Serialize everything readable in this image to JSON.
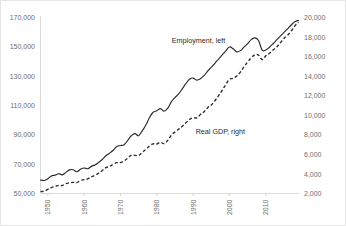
{
  "chart_data": {
    "type": "line",
    "title": "",
    "subtitle": "",
    "xlabel": "",
    "ylabel": "",
    "grid": false,
    "legend_position": "inline-annotation",
    "x": [
      1948,
      1949,
      1950,
      1951,
      1952,
      1953,
      1954,
      1955,
      1956,
      1957,
      1958,
      1959,
      1960,
      1961,
      1962,
      1963,
      1964,
      1965,
      1966,
      1967,
      1968,
      1969,
      1970,
      1971,
      1972,
      1973,
      1974,
      1975,
      1976,
      1977,
      1978,
      1979,
      1980,
      1981,
      1982,
      1983,
      1984,
      1985,
      1986,
      1987,
      1988,
      1989,
      1990,
      1991,
      1992,
      1993,
      1994,
      1995,
      1996,
      1997,
      1998,
      1999,
      2000,
      2001,
      2002,
      2003,
      2004,
      2005,
      2006,
      2007,
      2008,
      2009,
      2010,
      2011,
      2012,
      2013,
      2014,
      2015,
      2016,
      2017,
      2018,
      2019
    ],
    "x_tick_labels": [
      "1950",
      "1960",
      "1970",
      "1980",
      "1990",
      "2000",
      "2010"
    ],
    "x_tick_values": [
      1950,
      1960,
      1970,
      1980,
      1990,
      2000,
      2010
    ],
    "xlim": [
      1948,
      2019
    ],
    "series": [
      {
        "name": "Employment, left",
        "axis": "left",
        "style": "solid",
        "color": "#2a2a2a",
        "values": [
          59200,
          58900,
          60000,
          62000,
          62500,
          63500,
          62700,
          64400,
          66100,
          66200,
          64800,
          66500,
          67400,
          66900,
          68500,
          69500,
          71200,
          73200,
          75700,
          77500,
          79500,
          82000,
          82700,
          83300,
          86200,
          89400,
          90800,
          89400,
          92700,
          96700,
          101800,
          105400,
          106400,
          107900,
          106100,
          108100,
          112500,
          115400,
          117900,
          121300,
          124900,
          127900,
          128700,
          127300,
          128200,
          130300,
          133500,
          136100,
          138800,
          141700,
          144500,
          147300,
          149900,
          148700,
          146600,
          147400,
          149800,
          152200,
          154900,
          156100,
          154300,
          147800,
          147800,
          149700,
          152100,
          154700,
          157300,
          159800,
          162300,
          164900,
          167100,
          168000
        ],
        "ylim": [
          50000,
          170000
        ],
        "y_tick_values": [
          50000,
          70000,
          90000,
          110000,
          130000,
          150000,
          170000
        ],
        "y_tick_labels": [
          "50,000",
          "70,000",
          "90,000",
          "110,000",
          "130,000",
          "150,000",
          "170,000"
        ]
      },
      {
        "name": "Real GDP, right",
        "axis": "right",
        "style": "dashed",
        "color": "#2a2a2a",
        "values": [
          2200,
          2230,
          2420,
          2610,
          2710,
          2840,
          2820,
          3020,
          3080,
          3140,
          3110,
          3330,
          3410,
          3500,
          3710,
          3870,
          4090,
          4350,
          4640,
          4760,
          4990,
          5150,
          5160,
          5330,
          5610,
          5930,
          5900,
          5890,
          6210,
          6500,
          6860,
          7080,
          7060,
          7240,
          7100,
          7420,
          7960,
          8290,
          8580,
          8870,
          9230,
          9570,
          9750,
          9740,
          10080,
          10360,
          10780,
          11060,
          11490,
          12010,
          12540,
          13150,
          13680,
          13780,
          14020,
          14410,
          14960,
          15450,
          15880,
          16200,
          16150,
          15700,
          16080,
          16340,
          16680,
          16980,
          17420,
          17860,
          18190,
          18620,
          19150,
          19520
        ],
        "ylim": [
          2000,
          20000
        ],
        "y_tick_values": [
          2000,
          4000,
          6000,
          8000,
          10000,
          12000,
          14000,
          16000,
          18000,
          20000
        ],
        "y_tick_labels": [
          "2,000",
          "4,000",
          "6,000",
          "8,000",
          "10,000",
          "12,000",
          "14,000",
          "16,000",
          "18,000",
          "20,000"
        ]
      }
    ],
    "annotations": [
      {
        "text": "Employment, left",
        "x": 1991.5,
        "y_axis": "left",
        "y": 152500
      },
      {
        "text": "Real GDP, right",
        "x": 1997.5,
        "y_axis": "right",
        "y": 8100
      }
    ]
  },
  "axes": {
    "left_labels": [
      "170,000",
      "150,000",
      "130,000",
      "110,000",
      "90,000",
      "70,000",
      "50,000"
    ],
    "right_labels": [
      "20,000",
      "18,000",
      "16,000",
      "14,000",
      "12,000",
      "10,000",
      "8,000",
      "6,000",
      "4,000",
      "2,000"
    ],
    "x_labels": [
      "1950",
      "1960",
      "1970",
      "1980",
      "1990",
      "2000",
      "2010"
    ]
  }
}
